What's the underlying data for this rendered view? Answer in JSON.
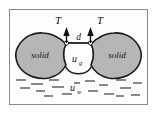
{
  "figure": {
    "frame": {
      "stroke": "#8a8a8a",
      "fill": "#fdfdfd",
      "x": 9,
      "y": 9,
      "width": 139,
      "height": 96
    },
    "colors": {
      "solid_fill": "#b6b6b6",
      "solid_stroke": "#1a1a1a",
      "meniscus_fill": "#ffffff",
      "meniscus_stroke": "#1a1a1a",
      "arrow": "#111111",
      "water_dash": "#2b2b2b",
      "text": "#111111",
      "frame_stroke": "#8a8a8a",
      "background": "#ffffff"
    },
    "labels": {
      "tension_left": "T",
      "tension_right": "T",
      "separation": "d",
      "gas_pressure": "u",
      "gas_pressure_sub": "g",
      "water_pressure": "u",
      "water_pressure_sub": "w",
      "solid_left": "solid",
      "solid_right": "solid"
    },
    "annotations": {
      "tension_arrow_direction": "up",
      "contact_points": 2,
      "water_dash_count": 18
    }
  }
}
